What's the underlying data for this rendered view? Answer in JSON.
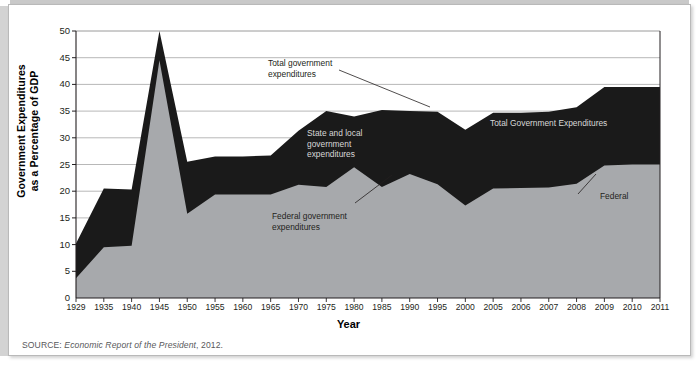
{
  "figure": {
    "y_axis_title": "Government Expenditures\nas a Percentage of GDP",
    "y_axis_title_line1": "Government Expenditures",
    "y_axis_title_line2": "as a Percentage of GDP",
    "x_axis_title": "Year",
    "source_prefix": "SOURCE: ",
    "source_italic": "Economic Report of the President",
    "source_suffix": ", 2012."
  },
  "annotations": {
    "total_gov_exp": {
      "line1": "Total government",
      "line2": "expenditures"
    },
    "state_local": {
      "line1": "State and local",
      "line2": "government",
      "line3": "expenditures"
    },
    "federal_gov_exp": {
      "line1": "Federal government",
      "line2": "expenditures"
    },
    "total_gov_exp_inner": {
      "text": "Total Government Expenditures"
    },
    "federal_inner": {
      "text": "Federal"
    }
  },
  "colors": {
    "federal_area": "#a7a9ac",
    "state_local_area": "#1a1a1a",
    "grid": "#9a9a9a",
    "axis": "#231f20",
    "background": "#ffffff",
    "frame_border": "#b9b9b9"
  },
  "chart_data": {
    "type": "area",
    "title": "",
    "xlabel": "Year",
    "ylabel": "Government Expenditures as a Percentage of GDP",
    "ylim": [
      0,
      50
    ],
    "yticks": [
      0,
      5,
      10,
      15,
      20,
      25,
      30,
      35,
      40,
      45,
      50
    ],
    "grid": true,
    "legend": "inline-annotations",
    "stacked": true,
    "categories": [
      "1929",
      "1935",
      "1940",
      "1945",
      "1950",
      "1955",
      "1960",
      "1965",
      "1970",
      "1975",
      "1980",
      "1985",
      "1990",
      "1995",
      "2000",
      "2005",
      "2006",
      "2007",
      "2008",
      "2009",
      "2010",
      "2011"
    ],
    "series": [
      {
        "name": "Federal government expenditures",
        "color": "#a7a9ac",
        "values": [
          3.7,
          9.5,
          9.8,
          44.5,
          15.8,
          19.4,
          19.4,
          19.4,
          21.2,
          20.8,
          24.5,
          20.8,
          23.2,
          21.3,
          17.3,
          20.5,
          20.6,
          20.7,
          21.4,
          24.8,
          25.0,
          25.0
        ]
      },
      {
        "name": "State and local government expenditures",
        "color": "#1a1a1a",
        "values": [
          6.5,
          11.0,
          10.5,
          5.5,
          9.7,
          7.1,
          7.1,
          7.3,
          10.1,
          14.2,
          9.5,
          14.4,
          11.8,
          13.6,
          14.2,
          14.2,
          14.1,
          14.2,
          14.3,
          14.7,
          14.5,
          14.5
        ]
      }
    ],
    "totals": {
      "name": "Total government expenditures",
      "values": [
        10.2,
        20.5,
        20.3,
        50.0,
        25.5,
        26.5,
        26.5,
        26.7,
        31.3,
        35.0,
        34.0,
        35.2,
        35.0,
        34.9,
        31.5,
        34.7,
        34.7,
        34.9,
        35.7,
        39.5,
        39.5,
        39.5
      ]
    }
  }
}
